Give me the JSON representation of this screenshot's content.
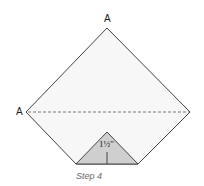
{
  "diagram": {
    "labels": {
      "top": "A",
      "left": "A"
    },
    "measurement": "1½\"",
    "caption": "Step 4",
    "colors": {
      "paper": "#f7f7f7",
      "fold": "#cfcfcf",
      "stroke": "#444444"
    }
  }
}
